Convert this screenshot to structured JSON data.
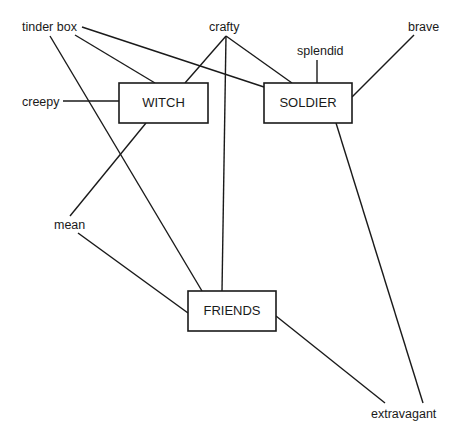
{
  "diagram": {
    "type": "concept-map",
    "colors": {
      "ink": "#1a1a1a",
      "background": "#ffffff"
    },
    "nodes": {
      "witch": {
        "label": "WITCH",
        "box": [
          119,
          83,
          89,
          40
        ]
      },
      "soldier": {
        "label": "SOLDIER",
        "box": [
          264,
          83,
          88,
          40
        ]
      },
      "friends": {
        "label": "FRIENDS",
        "box": [
          188,
          291,
          88,
          40
        ]
      }
    },
    "attributes": {
      "tinder_box": {
        "label": "tinder box",
        "pos": [
          22,
          31
        ]
      },
      "crafty": {
        "label": "crafty",
        "pos": [
          209,
          31
        ]
      },
      "splendid": {
        "label": "splendid",
        "pos": [
          297,
          55
        ]
      },
      "brave": {
        "label": "brave",
        "pos": [
          408,
          31
        ]
      },
      "creepy": {
        "label": "creepy",
        "pos": [
          22,
          106
        ]
      },
      "mean": {
        "label": "mean",
        "pos": [
          54,
          229
        ]
      },
      "extravagant": {
        "label": "extravagant",
        "pos": [
          371,
          418
        ]
      }
    },
    "edges": [
      {
        "from": "tinder box",
        "to": "WITCH",
        "line": [
          75,
          35,
          155,
          83
        ]
      },
      {
        "from": "tinder box",
        "to": "SOLDIER",
        "line": [
          82,
          27,
          264,
          87
        ]
      },
      {
        "from": "tinder box",
        "to": "FRIENDS",
        "line": [
          50,
          36,
          202,
          291
        ]
      },
      {
        "from": "crafty",
        "to": "WITCH",
        "line": [
          226,
          36,
          185,
          83
        ]
      },
      {
        "from": "crafty",
        "to": "SOLDIER",
        "line": [
          226,
          36,
          292,
          83
        ]
      },
      {
        "from": "crafty",
        "to": "FRIENDS",
        "line": [
          226,
          36,
          222,
          291
        ]
      },
      {
        "from": "splendid",
        "to": "SOLDIER",
        "line": [
          317,
          60,
          317,
          83
        ]
      },
      {
        "from": "brave",
        "to": "SOLDIER",
        "line": [
          414,
          35,
          352,
          97
        ]
      },
      {
        "from": "creepy",
        "to": "WITCH",
        "line": [
          63,
          101,
          119,
          101
        ]
      },
      {
        "from": "WITCH",
        "to": "mean",
        "line": [
          146,
          123,
          70,
          216
        ]
      },
      {
        "from": "mean",
        "to": "FRIENDS",
        "line": [
          78,
          233,
          188,
          313
        ]
      },
      {
        "from": "FRIENDS",
        "to": "extravagant",
        "line": [
          276,
          316,
          385,
          403
        ]
      },
      {
        "from": "SOLDIER",
        "to": "extravagant",
        "line": [
          336,
          123,
          423,
          403
        ]
      }
    ]
  }
}
